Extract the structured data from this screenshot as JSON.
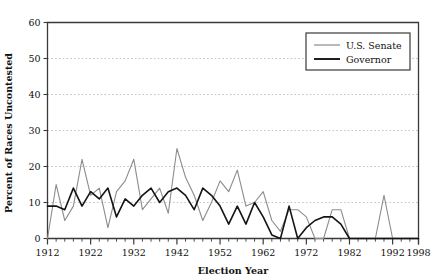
{
  "chart_data": {
    "type": "line",
    "title": "",
    "xlabel": "Election Year",
    "ylabel": "Percent of Races Uncontested",
    "xlim": [
      1912,
      1998
    ],
    "ylim": [
      0,
      60
    ],
    "ytick_step": 10,
    "yticks": [
      0,
      10,
      20,
      30,
      40,
      50,
      60
    ],
    "xticks": [
      1912,
      1922,
      1932,
      1942,
      1952,
      1962,
      1972,
      1982,
      1992,
      1998
    ],
    "xtick_labels": [
      "1912",
      "1922",
      "1932",
      "1942",
      "1952",
      "1962",
      "1972",
      "1982",
      "1992",
      "1998"
    ],
    "ytick_labels": [
      "0",
      "10",
      "20",
      "30",
      "40",
      "50",
      "60"
    ],
    "minor_xtick_step": 2,
    "grid": "horizontal-dashed",
    "legend_position": "top-right",
    "x": [
      1912,
      1914,
      1916,
      1918,
      1920,
      1922,
      1924,
      1926,
      1928,
      1930,
      1932,
      1934,
      1936,
      1938,
      1940,
      1942,
      1944,
      1946,
      1948,
      1950,
      1952,
      1954,
      1956,
      1958,
      1960,
      1962,
      1964,
      1966,
      1968,
      1970,
      1972,
      1974,
      1976,
      1978,
      1980,
      1982,
      1984,
      1986,
      1988,
      1990,
      1992,
      1994,
      1996,
      1998
    ],
    "series": [
      {
        "name": "U.S. Senate",
        "color": "#8c8c8c",
        "linewidth": 1.1,
        "values": [
          0,
          15,
          5,
          9,
          22,
          12,
          14,
          3,
          13,
          16,
          22,
          8,
          11,
          14,
          7,
          25,
          17,
          12,
          5,
          10,
          16,
          13,
          19,
          9,
          10,
          13,
          5,
          2,
          8,
          8,
          6,
          0,
          0,
          8,
          8,
          0,
          0,
          0,
          0,
          12,
          0,
          0,
          0,
          0
        ]
      },
      {
        "name": "Governor",
        "color": "#141414",
        "linewidth": 1.6,
        "values": [
          9,
          9,
          8,
          14,
          9,
          13,
          11,
          14,
          6,
          11,
          9,
          12,
          14,
          10,
          13,
          14,
          12,
          8,
          14,
          12,
          9,
          4,
          9,
          4,
          10,
          6,
          1,
          0,
          9,
          0,
          3,
          5,
          6,
          6,
          4,
          0,
          0,
          0,
          0,
          0,
          0,
          0,
          0,
          0
        ]
      }
    ],
    "legend": [
      {
        "label": "U.S. Senate",
        "color": "#8c8c8c",
        "linewidth": 1.1
      },
      {
        "label": "Governor",
        "color": "#141414",
        "linewidth": 1.6
      }
    ]
  },
  "axes": {
    "frame_color": "#3a3a3a",
    "grid_color": "#aaaaaa"
  }
}
